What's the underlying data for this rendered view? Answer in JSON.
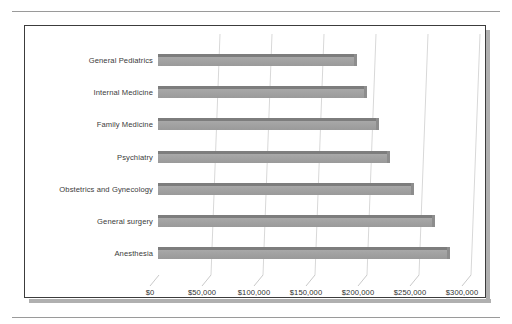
{
  "figure": {
    "frame_color": "#3c3c3c",
    "background": "#ffffff",
    "bar_color": "#a0a0a0",
    "bar_top_color": "#7d7d7d",
    "gridline_color": "#d8d8d8",
    "text_color": "#3b3b3b"
  },
  "chart_data": {
    "type": "bar",
    "orientation": "horizontal",
    "title": "",
    "subtitle": "",
    "xlabel": "",
    "ylabel": "",
    "categories": [
      "General Pediatrics",
      "Internal Medicine",
      "Family Medicine",
      "Psychiatry",
      "Obstetrics and Gynecology",
      "General surgery",
      "Anesthesia"
    ],
    "values": [
      190000,
      200000,
      212000,
      222000,
      245000,
      265000,
      280000
    ],
    "xlim": [
      0,
      300000
    ],
    "xticks": [
      0,
      50000,
      100000,
      150000,
      200000,
      250000,
      300000
    ],
    "xticklabels": [
      "$0",
      "$50,000",
      "$100,000",
      "$150,000",
      "$200,000",
      "$250,000",
      "$300,000"
    ],
    "grid": true,
    "grid_axis": "x",
    "legend": false,
    "legend_position": "none",
    "style_3d": true
  }
}
